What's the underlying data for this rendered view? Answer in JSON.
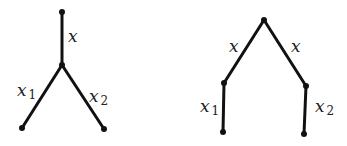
{
  "diagrams": [
    {
      "name": "tree-left",
      "nodes": [
        {
          "id": "top",
          "x": 62,
          "y": 12
        },
        {
          "id": "junction",
          "x": 62,
          "y": 65
        },
        {
          "id": "leaf1",
          "x": 22,
          "y": 128
        },
        {
          "id": "leaf2",
          "x": 104,
          "y": 129
        }
      ],
      "edges": [
        {
          "from": "top",
          "to": "junction",
          "label": "x",
          "sub": ""
        },
        {
          "from": "junction",
          "to": "leaf1",
          "label": "x",
          "sub": "1"
        },
        {
          "from": "junction",
          "to": "leaf2",
          "label": "x",
          "sub": "2"
        }
      ]
    },
    {
      "name": "tree-right",
      "nodes": [
        {
          "id": "root",
          "x": 264,
          "y": 20
        },
        {
          "id": "left",
          "x": 224,
          "y": 83
        },
        {
          "id": "right",
          "x": 306,
          "y": 86
        },
        {
          "id": "leaf1",
          "x": 223,
          "y": 132
        },
        {
          "id": "leaf2",
          "x": 304,
          "y": 134
        }
      ],
      "edges": [
        {
          "from": "root",
          "to": "left",
          "label": "x",
          "sub": ""
        },
        {
          "from": "root",
          "to": "right",
          "label": "x",
          "sub": ""
        },
        {
          "from": "left",
          "to": "leaf1",
          "label": "x",
          "sub": "1"
        },
        {
          "from": "right",
          "to": "leaf2",
          "label": "x",
          "sub": "2"
        }
      ]
    }
  ],
  "labels": {
    "x": "x",
    "one": "1",
    "two": "2"
  }
}
